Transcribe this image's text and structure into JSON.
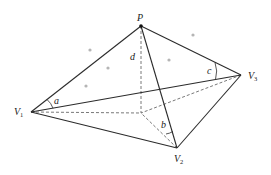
{
  "figure": {
    "colors": {
      "line": "#2b2b2b",
      "dashed": "#555555",
      "dot": "#b5b5b5",
      "background": "#ffffff"
    },
    "points": {
      "P": {
        "label": "P",
        "x": 141,
        "y": 26
      },
      "V1": {
        "label": "V",
        "sub": "1",
        "x": 31,
        "y": 112
      },
      "V2": {
        "label": "V",
        "sub": "2",
        "x": 177,
        "y": 148
      },
      "V3": {
        "label": "V",
        "sub": "3",
        "x": 241,
        "y": 75
      },
      "F": {
        "x": 141,
        "y": 113
      }
    },
    "labels": {
      "P": "P",
      "V": "V",
      "sub1": "1",
      "sub2": "2",
      "sub3": "3",
      "d": "d",
      "a": "a",
      "b": "b",
      "c": "c"
    },
    "solid_edges": [
      [
        "P",
        "V1"
      ],
      [
        "P",
        "V2"
      ],
      [
        "P",
        "V3"
      ],
      [
        "V1",
        "V2"
      ],
      [
        "V2",
        "V3"
      ],
      [
        "V1",
        "V3"
      ]
    ],
    "dashed_edges": [
      [
        "P",
        "F"
      ],
      [
        "V1",
        "F"
      ],
      [
        "V2",
        "F"
      ],
      [
        "V3",
        "F"
      ]
    ],
    "dots": [
      [
        90,
        50
      ],
      [
        108,
        68
      ],
      [
        86,
        86
      ],
      [
        169,
        60
      ],
      [
        193,
        35
      ]
    ]
  }
}
